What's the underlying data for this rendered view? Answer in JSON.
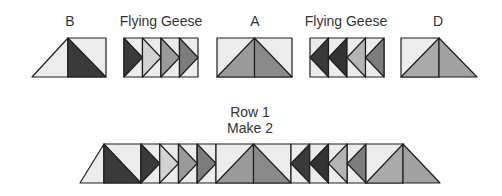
{
  "labels": {
    "block_b": "B",
    "flying_geese_1": "Flying Geese",
    "block_a": "A",
    "flying_geese_2": "Flying Geese",
    "block_d": "D",
    "row_title": "Row 1",
    "row_instruction": "Make 2"
  },
  "colors": {
    "light": "#ececec",
    "pale": "#d2d2d2",
    "medium": "#9a9a9a",
    "mid_dark": "#7c7c7c",
    "dark": "#3a3a3a",
    "stroke": "#1e1e1e"
  },
  "components": [
    {
      "name": "B",
      "description": "Light half-square triangle with a dark triangle on the right"
    },
    {
      "name": "Flying Geese",
      "description": "Four geese pointing right: dark, pale, medium, mid-dark"
    },
    {
      "name": "A",
      "description": "Large medium-gray triangle on a light background"
    },
    {
      "name": "Flying Geese",
      "description": "Four geese pointing left: dark, dark, pale, mid-dark"
    },
    {
      "name": "D",
      "description": "Medium triangle with a medium triangle extension on the right"
    }
  ]
}
